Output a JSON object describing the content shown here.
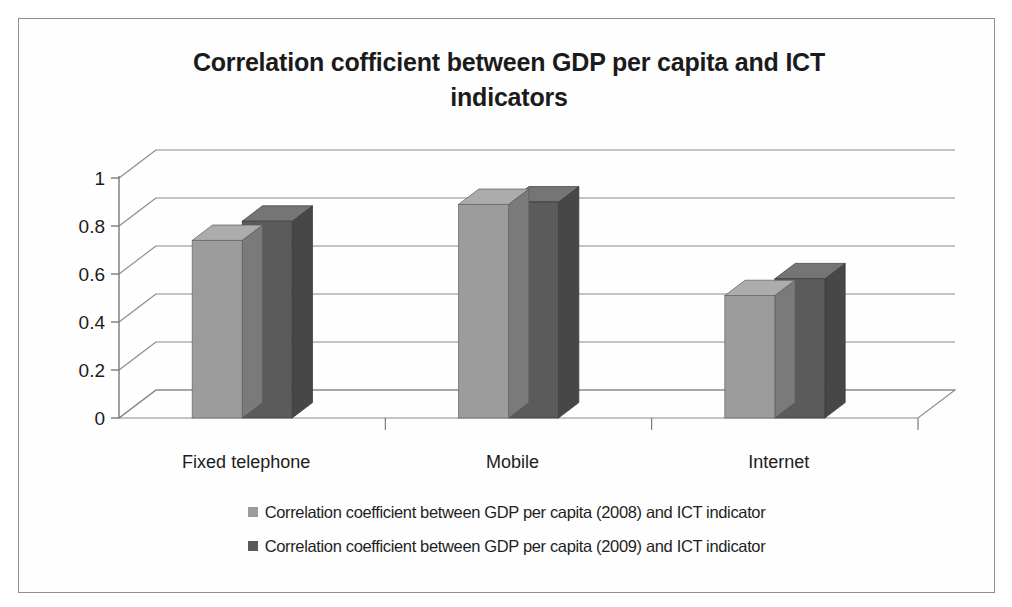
{
  "chart_data": {
    "type": "bar",
    "title": "Correlation cofficient between GDP per capita and ICT indicators",
    "xlabel": "",
    "ylabel": "",
    "categories": [
      "Fixed telephone",
      "Mobile",
      "Internet"
    ],
    "series": [
      {
        "name": "Correlation coefficient between GDP per capita (2008) and ICT indicator",
        "color": "#9c9c9c",
        "values": [
          0.74,
          0.89,
          0.51
        ]
      },
      {
        "name": "Correlation coefficient between GDP per capita (2009) and ICT indicator",
        "color": "#5b5b5b",
        "values": [
          0.82,
          0.9,
          0.58
        ]
      }
    ],
    "ylim": [
      0,
      1
    ],
    "yticks": [
      "0",
      "0.2",
      "0.4",
      "0.6",
      "0.8",
      "1"
    ],
    "ytick_values": [
      0,
      0.2,
      0.4,
      0.6,
      0.8,
      1
    ],
    "grid": true,
    "three_d": true,
    "legend_position": "bottom"
  },
  "chart": {
    "title_line_1": "Correlation cofficient between GDP per capita and ICT",
    "title_line_2": "indicators",
    "frame_color": "#8e8e92",
    "gridline_color": "#8a8a8a",
    "axis_color": "#6e6e6e"
  },
  "legend": {
    "rows": [
      {
        "swatch_color": "#9c9c9c",
        "label": "Correlation coefficient between GDP per capita (2008) and ICT indicator"
      },
      {
        "swatch_color": "#5b5b5b",
        "label": "Correlation coefficient between GDP per capita (2009) and ICT indicator"
      }
    ]
  }
}
